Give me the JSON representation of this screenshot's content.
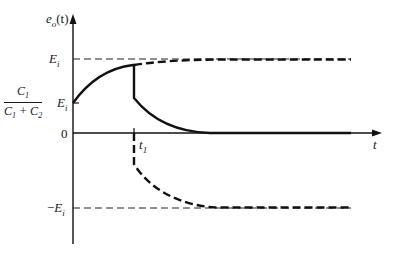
{
  "diagram": {
    "title": "",
    "type": "waveform",
    "colors": {
      "line": "#111111",
      "background": "#ffffff"
    },
    "axes": {
      "y_label": {
        "var": "e",
        "sub": "o",
        "arg": "(t)"
      },
      "x_label": "t",
      "y_ticks": [
        {
          "label_var": "E",
          "label_sub": "i",
          "meaning": "E_i"
        },
        {
          "label_fraction": {
            "num_var": "C",
            "num_sub": "1",
            "den": "C1 + C2"
          },
          "label_var": "E",
          "label_sub": "i",
          "meaning": "C1/(C1+C2) E_i"
        },
        {
          "label": "0",
          "meaning": "0"
        },
        {
          "label_prefix": "−",
          "label_var": "E",
          "label_sub": "i",
          "meaning": "-E_i"
        }
      ],
      "x_ticks": [
        {
          "label_var": "t",
          "label_sub": "1",
          "meaning": "t_1"
        }
      ]
    },
    "labels": {
      "y_axis_e": "e",
      "y_axis_o": "o",
      "y_axis_arg": "(t)",
      "ei_top_E": "E",
      "ei_top_i": "i",
      "frac_num_C": "C",
      "frac_num_1": "1",
      "frac_den_C1": "C",
      "frac_den_1": "1",
      "frac_den_plus": " + C",
      "frac_den_2": "2",
      "frac_E": "E",
      "frac_i": "i",
      "zero": "0",
      "t1_t": "t",
      "t1_1": "1",
      "neg_minus": "−",
      "neg_E": "E",
      "neg_i": "i",
      "x_axis_t": "t"
    },
    "curves": [
      {
        "name": "solid-charging-then-decay",
        "style": "solid",
        "description": "Rises exponentially from C1/(C1+C2)·Ei toward Ei until t1, drops at t1, then decays to 0"
      },
      {
        "name": "dashed-continuation-to-Ei",
        "style": "dashed-bold",
        "description": "Continues charging toward Ei after t1"
      },
      {
        "name": "dashed-negative-branch",
        "style": "dashed-bold",
        "description": "Drops negative at t1 and approaches −Ei"
      },
      {
        "name": "reference-Ei",
        "style": "dashed-thin"
      },
      {
        "name": "reference-neg-Ei",
        "style": "dashed-thin"
      }
    ]
  }
}
